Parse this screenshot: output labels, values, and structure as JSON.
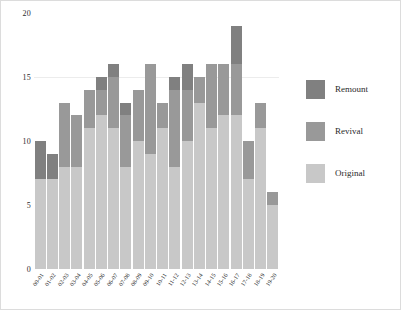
{
  "chart_data": {
    "type": "bar",
    "title": "",
    "xlabel": "",
    "ylabel": "",
    "stacked": true,
    "grid": true,
    "legend_position": "right",
    "ylim": [
      0,
      20
    ],
    "yticks": [
      0,
      5,
      10,
      15,
      20
    ],
    "ytick_labels": [
      "0",
      "5",
      "10",
      "15",
      "20"
    ],
    "categories": [
      "00-01",
      "01-02",
      "02-03",
      "03-04",
      "04-05",
      "05-06",
      "06-07",
      "07-08",
      "08-09",
      "09-10",
      "10-11",
      "11-12",
      "12-13",
      "13-14",
      "14-15",
      "15-16",
      "16-17",
      "17-18",
      "18-19",
      "19-20"
    ],
    "series": [
      {
        "name": "Original",
        "color": "#c8c8c8",
        "values": [
          7,
          7,
          8,
          8,
          11,
          12,
          11,
          8,
          10,
          9,
          11,
          8,
          10,
          13,
          11,
          12,
          12,
          7,
          11,
          5
        ]
      },
      {
        "name": "Revival",
        "color": "#999999",
        "values": [
          0,
          0,
          5,
          4,
          3,
          2,
          4,
          4,
          4,
          7,
          2,
          6,
          4,
          2,
          5,
          4,
          4,
          3,
          2,
          1
        ]
      },
      {
        "name": "Remount",
        "color": "#808080",
        "values": [
          3,
          2,
          0,
          0,
          0,
          1,
          1,
          1,
          0,
          0,
          0,
          1,
          2,
          0,
          0,
          0,
          3,
          0,
          0,
          0
        ]
      }
    ],
    "totals": [
      10,
      9,
      13,
      12,
      14,
      15,
      16,
      13,
      14,
      16,
      13,
      15,
      16,
      15,
      16,
      16,
      19,
      10,
      13,
      6
    ]
  },
  "legend": {
    "entries": [
      {
        "label": "Remount",
        "color": "#808080"
      },
      {
        "label": "Revival",
        "color": "#999999"
      },
      {
        "label": "Original",
        "color": "#c8c8c8"
      }
    ]
  }
}
